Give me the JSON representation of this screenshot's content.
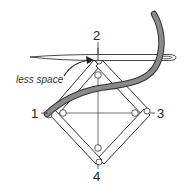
{
  "diagram": {
    "type": "needlework-frame-illustration",
    "corner_labels": [
      {
        "id": "1",
        "text": "1"
      },
      {
        "id": "2",
        "text": "2"
      },
      {
        "id": "3",
        "text": "3"
      },
      {
        "id": "4",
        "text": "4"
      }
    ],
    "annotation": {
      "text": "less space"
    },
    "colors": {
      "outline": "#333333",
      "thread": "#8a8a8a",
      "needle_fill": "#ffffff",
      "background": "#ffffff"
    }
  }
}
